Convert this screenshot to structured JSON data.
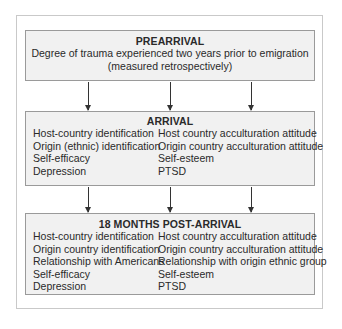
{
  "stages": [
    {
      "title": "PREARRIVAL",
      "description": [
        "Degree of trauma experienced two years prior to emigration",
        "(measured retrospectively)"
      ]
    },
    {
      "title": "ARRIVAL",
      "left": [
        "Host-country identification",
        "Origin (ethnic) identification",
        "Self-efficacy",
        "Depression"
      ],
      "right": [
        "Host country acculturation attitude",
        "Origin country acculturation attitude",
        "Self-esteem",
        "PTSD"
      ]
    },
    {
      "title": "18 MONTHS POST-ARRIVAL",
      "left": [
        "Host-country identification",
        "Origin country identification",
        "Relationship with Americans",
        "Self-efficacy",
        "Depression"
      ],
      "right": [
        "Host country acculturation attitude",
        "Origin country acculturation attitude",
        "Relationship with origin ethnic group",
        "Self-esteem",
        "PTSD"
      ]
    }
  ],
  "colors": {
    "box_fill": "#f1f1f1",
    "box_border": "#9a9a9a",
    "arrow": "#333333"
  }
}
